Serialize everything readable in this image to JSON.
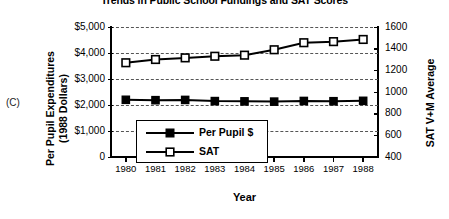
{
  "panel_label": "(C)",
  "chart_data": {
    "type": "line",
    "title": "Trends in Public School Fundings and SAT Scores",
    "xlabel": "Year",
    "categories": [
      "1980",
      "1981",
      "1982",
      "1983",
      "1984",
      "1985",
      "1986",
      "1987",
      "1988"
    ],
    "grid": true,
    "legend_position": "inside-bottom-center",
    "axes": {
      "left": {
        "label": "Per Pupil Expenditures (1988 Dollars)",
        "label_line1": "Per Pupil Expenditures",
        "label_line2": "(1988 Dollars)",
        "ticks": [
          "$5,000",
          "$4,000",
          "$3,000",
          "$2,000",
          "$1,000",
          "0"
        ],
        "tick_values": [
          5000,
          4000,
          3000,
          2000,
          1000,
          0
        ],
        "ylim": [
          0,
          5000
        ]
      },
      "right": {
        "label": "SAT V+M Average",
        "ticks": [
          "1600",
          "1400",
          "1200",
          "1000",
          "800",
          "600",
          "400"
        ],
        "tick_values": [
          1600,
          1400,
          1200,
          1000,
          800,
          600,
          400
        ],
        "ylim": [
          400,
          1600
        ]
      }
    },
    "series": [
      {
        "name": "Per Pupil $",
        "legend_label": "Per Pupil $",
        "axis": "left",
        "marker": "filled-square",
        "color": "#000000",
        "values": [
          2200,
          2185,
          2195,
          2150,
          2140,
          2130,
          2155,
          2145,
          2160
        ]
      },
      {
        "name": "SAT",
        "legend_label": "SAT",
        "axis": "right",
        "marker": "open-square",
        "color": "#000000",
        "values": [
          1270,
          1300,
          1315,
          1330,
          1340,
          1390,
          1455,
          1465,
          1485
        ]
      }
    ]
  }
}
